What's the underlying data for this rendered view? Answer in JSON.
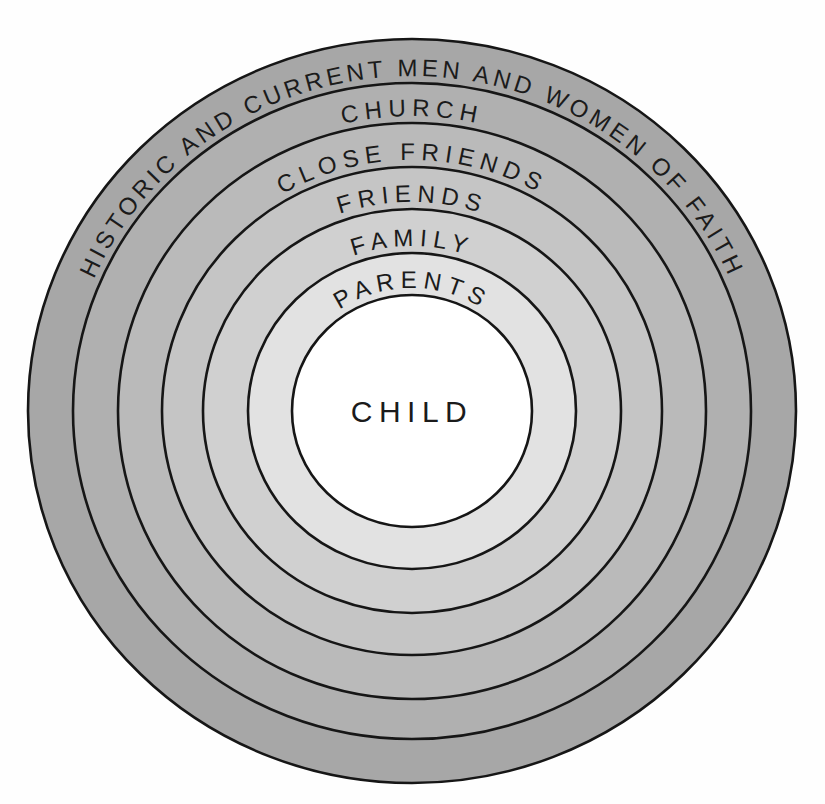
{
  "figure": {
    "background_color": "#fefefe",
    "outline_color": "#161616",
    "text_color": "#1b1b1b",
    "center": {
      "x": 412,
      "y": 411
    },
    "rings": [
      {
        "label": "HISTORIC AND CURRENT MEN AND WOMEN OF FAITH",
        "rx": 384,
        "ry": 372,
        "fill": "#a7a7a7"
      },
      {
        "label": "CHURCH",
        "rx": 339,
        "ry": 328,
        "fill": "#b0b0b0"
      },
      {
        "label": "CLOSE FRIENDS",
        "rx": 294,
        "ry": 288,
        "fill": "#bababa"
      },
      {
        "label": "FRIENDS",
        "rx": 250,
        "ry": 244,
        "fill": "#c5c5c5"
      },
      {
        "label": "FAMILY",
        "rx": 209,
        "ry": 202,
        "fill": "#d0d0d0"
      },
      {
        "label": "PARENTS",
        "rx": 164,
        "ry": 158,
        "fill": "#e2e2e2"
      }
    ],
    "center_circle": {
      "label": "CHILD",
      "rx": 120,
      "ry": 116,
      "fill": "#ffffff"
    }
  }
}
